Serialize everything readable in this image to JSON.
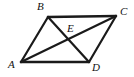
{
  "figure": {
    "kind": "geometry-diagram",
    "shape": "parallelogram",
    "background_color": "#ffffff",
    "stroke_color": "#1a1a1a",
    "canvas": {
      "width": 134,
      "height": 77
    },
    "labels": {
      "a": "A",
      "b": "B",
      "c": "C",
      "d": "D",
      "e": "E"
    },
    "points": {
      "A": {
        "x": 21,
        "y": 62
      },
      "B": {
        "x": 48,
        "y": 17
      },
      "C": {
        "x": 116,
        "y": 16
      },
      "D": {
        "x": 89,
        "y": 62
      },
      "E": {
        "x": 72,
        "y": 40
      }
    },
    "segments": [
      {
        "name": "AB",
        "from": "A",
        "to": "B",
        "role": "side",
        "width": 2.2
      },
      {
        "name": "BC",
        "from": "B",
        "to": "C",
        "role": "side",
        "width": 2.6
      },
      {
        "name": "CD",
        "from": "C",
        "to": "D",
        "role": "side",
        "width": 2.2
      },
      {
        "name": "DA",
        "from": "D",
        "to": "A",
        "role": "side",
        "width": 2.6
      },
      {
        "name": "AC",
        "from": "A",
        "to": "C",
        "role": "diagonal",
        "width": 2.2
      },
      {
        "name": "BD",
        "from": "B",
        "to": "D",
        "role": "diagonal",
        "width": 2.2
      }
    ]
  }
}
